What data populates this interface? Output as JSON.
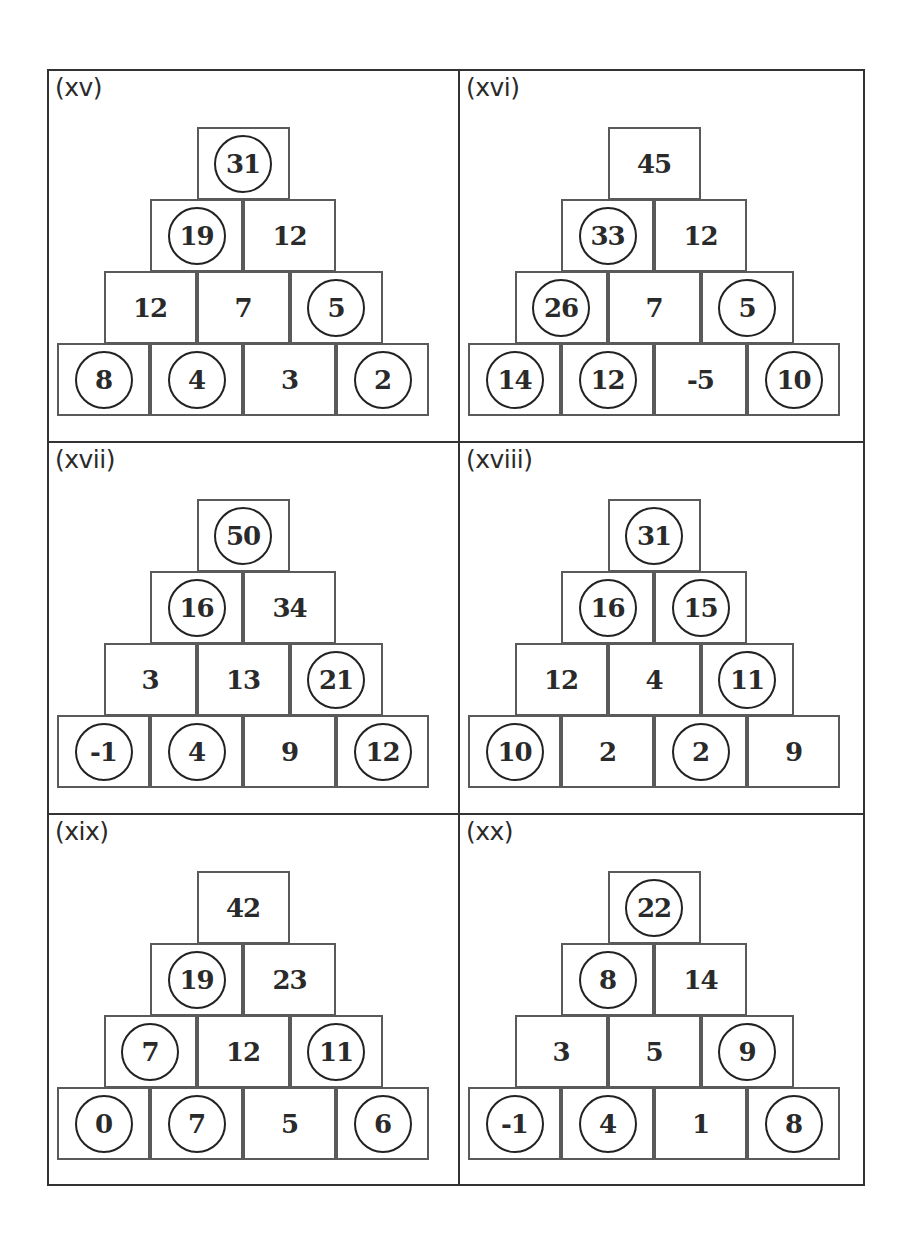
{
  "worksheet": {
    "panels": [
      {
        "label": "(xv)",
        "rows": [
          [
            {
              "v": "31",
              "c": true
            }
          ],
          [
            {
              "v": "19",
              "c": true
            },
            {
              "v": "12",
              "c": false
            }
          ],
          [
            {
              "v": "12",
              "c": false
            },
            {
              "v": "7",
              "c": false
            },
            {
              "v": "5",
              "c": true
            }
          ],
          [
            {
              "v": "8",
              "c": true
            },
            {
              "v": "4",
              "c": true
            },
            {
              "v": "3",
              "c": false
            },
            {
              "v": "2",
              "c": true
            }
          ]
        ]
      },
      {
        "label": "(xvi)",
        "rows": [
          [
            {
              "v": "45",
              "c": false
            }
          ],
          [
            {
              "v": "33",
              "c": true
            },
            {
              "v": "12",
              "c": false
            }
          ],
          [
            {
              "v": "26",
              "c": true
            },
            {
              "v": "7",
              "c": false
            },
            {
              "v": "5",
              "c": true
            }
          ],
          [
            {
              "v": "14",
              "c": true
            },
            {
              "v": "12",
              "c": true
            },
            {
              "v": "-5",
              "c": false
            },
            {
              "v": "10",
              "c": true
            }
          ]
        ]
      },
      {
        "label": "(xvii)",
        "rows": [
          [
            {
              "v": "50",
              "c": true
            }
          ],
          [
            {
              "v": "16",
              "c": true
            },
            {
              "v": "34",
              "c": false
            }
          ],
          [
            {
              "v": "3",
              "c": false
            },
            {
              "v": "13",
              "c": false
            },
            {
              "v": "21",
              "c": true
            }
          ],
          [
            {
              "v": "-1",
              "c": true
            },
            {
              "v": "4",
              "c": true
            },
            {
              "v": "9",
              "c": false
            },
            {
              "v": "12",
              "c": true
            }
          ]
        ]
      },
      {
        "label": "(xviii)",
        "rows": [
          [
            {
              "v": "31",
              "c": true
            }
          ],
          [
            {
              "v": "16",
              "c": true
            },
            {
              "v": "15",
              "c": true
            }
          ],
          [
            {
              "v": "12",
              "c": false
            },
            {
              "v": "4",
              "c": false
            },
            {
              "v": "11",
              "c": true
            }
          ],
          [
            {
              "v": "10",
              "c": true
            },
            {
              "v": "2",
              "c": false
            },
            {
              "v": "2",
              "c": true
            },
            {
              "v": "9",
              "c": false
            }
          ]
        ]
      },
      {
        "label": "(xix)",
        "rows": [
          [
            {
              "v": "42",
              "c": false
            }
          ],
          [
            {
              "v": "19",
              "c": true
            },
            {
              "v": "23",
              "c": false
            }
          ],
          [
            {
              "v": "7",
              "c": true
            },
            {
              "v": "12",
              "c": false
            },
            {
              "v": "11",
              "c": true
            }
          ],
          [
            {
              "v": "0",
              "c": true
            },
            {
              "v": "7",
              "c": true
            },
            {
              "v": "5",
              "c": false
            },
            {
              "v": "6",
              "c": true
            }
          ]
        ]
      },
      {
        "label": "(xx)",
        "rows": [
          [
            {
              "v": "22",
              "c": true
            }
          ],
          [
            {
              "v": "8",
              "c": true
            },
            {
              "v": "14",
              "c": false
            }
          ],
          [
            {
              "v": "3",
              "c": false
            },
            {
              "v": "5",
              "c": false
            },
            {
              "v": "9",
              "c": true
            }
          ],
          [
            {
              "v": "-1",
              "c": true
            },
            {
              "v": "4",
              "c": true
            },
            {
              "v": "1",
              "c": false
            },
            {
              "v": "8",
              "c": true
            }
          ]
        ]
      }
    ]
  }
}
